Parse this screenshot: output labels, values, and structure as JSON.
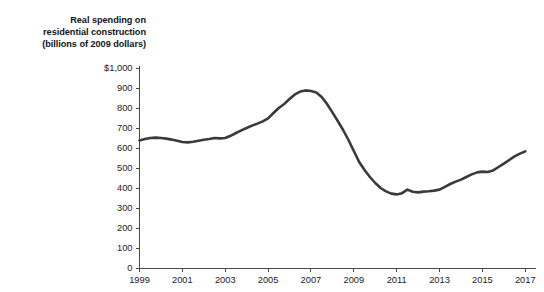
{
  "chart_data": {
    "type": "line",
    "title": "Real spending on\nresidential construction\n(billions of 2009 dollars)",
    "title_line1": "Real spending on",
    "title_line2": "residential construction",
    "title_line3": "(billions of 2009 dollars)",
    "xlabel": "",
    "ylabel": "",
    "xlim": [
      1999,
      2017.5
    ],
    "ylim": [
      0,
      1000
    ],
    "grid": false,
    "legend": false,
    "line_color": "#3a3a3a",
    "axis_color": "#4a4a4a",
    "y_ticks": [
      0,
      100,
      200,
      300,
      400,
      500,
      600,
      700,
      800,
      900,
      1000
    ],
    "y_tick_labels": [
      "0",
      "100",
      "200",
      "300",
      "400",
      "500",
      "600",
      "700",
      "800",
      "900",
      "$1,000"
    ],
    "x_ticks": [
      1999,
      2001,
      2003,
      2005,
      2007,
      2009,
      2011,
      2013,
      2015,
      2017
    ],
    "x_tick_labels": [
      "1999",
      "2001",
      "2003",
      "2005",
      "2007",
      "2009",
      "2011",
      "2013",
      "2015",
      "2017"
    ],
    "series": [
      {
        "name": "Real spending on residential construction",
        "x": [
          1999.0,
          1999.25,
          1999.5,
          1999.75,
          2000.0,
          2000.25,
          2000.5,
          2000.75,
          2001.0,
          2001.25,
          2001.5,
          2001.75,
          2002.0,
          2002.25,
          2002.5,
          2002.75,
          2003.0,
          2003.25,
          2003.5,
          2003.75,
          2004.0,
          2004.25,
          2004.5,
          2004.75,
          2005.0,
          2005.25,
          2005.5,
          2005.75,
          2006.0,
          2006.25,
          2006.5,
          2006.75,
          2007.0,
          2007.25,
          2007.5,
          2007.75,
          2008.0,
          2008.25,
          2008.5,
          2008.75,
          2009.0,
          2009.25,
          2009.5,
          2009.75,
          2010.0,
          2010.25,
          2010.5,
          2010.75,
          2011.0,
          2011.25,
          2011.5,
          2011.75,
          2012.0,
          2012.25,
          2012.5,
          2012.75,
          2013.0,
          2013.25,
          2013.5,
          2013.75,
          2014.0,
          2014.25,
          2014.5,
          2014.75,
          2015.0,
          2015.25,
          2015.5,
          2015.75,
          2016.0,
          2016.25,
          2016.5,
          2016.75,
          2017.0
        ],
        "values": [
          638,
          645,
          650,
          652,
          650,
          647,
          642,
          636,
          630,
          628,
          631,
          636,
          641,
          645,
          650,
          648,
          650,
          661,
          675,
          688,
          700,
          712,
          722,
          733,
          748,
          775,
          800,
          820,
          845,
          868,
          882,
          888,
          885,
          878,
          855,
          820,
          778,
          735,
          690,
          640,
          585,
          530,
          490,
          455,
          425,
          400,
          383,
          372,
          368,
          374,
          392,
          381,
          378,
          382,
          384,
          387,
          392,
          406,
          420,
          432,
          442,
          455,
          468,
          478,
          482,
          480,
          488,
          505,
          522,
          540,
          558,
          572,
          583
        ]
      }
    ],
    "annotations": []
  }
}
